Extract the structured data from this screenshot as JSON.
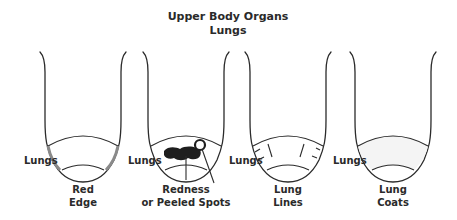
{
  "title": {
    "line1": "Upper Body Organs",
    "line2": "Lungs"
  },
  "colors": {
    "outline": "#2b2b2b",
    "text": "#2a2a2a",
    "red_edge_shade": "#8a8a8a",
    "spot_fill": "#1e1e1e",
    "coat_fill": "#f4f4f4",
    "background": "#ffffff"
  },
  "tongues": [
    {
      "zone_label": "Lungs",
      "caption_line1": "Red",
      "caption_line2": "Edge",
      "feature": "red-edge"
    },
    {
      "zone_label": "Lungs",
      "caption_line1": "Redness",
      "caption_line2": "or Peeled Spots",
      "feature": "redness-or-peeled-spots"
    },
    {
      "zone_label": "Lungs",
      "caption_line1": "Lung",
      "caption_line2": "Lines",
      "feature": "lung-lines"
    },
    {
      "zone_label": "Lungs",
      "caption_line1": "Lung",
      "caption_line2": "Coats",
      "feature": "lung-coats"
    }
  ]
}
